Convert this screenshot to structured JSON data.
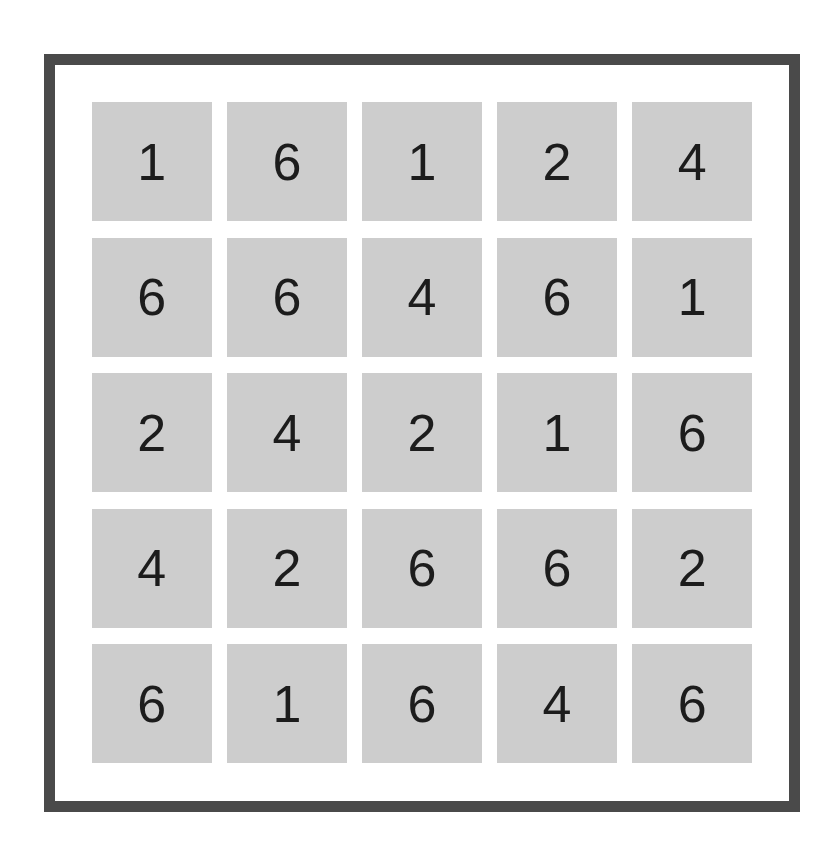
{
  "page": {
    "background_color": "#ffffff"
  },
  "panel": {
    "border_color": "#4a4a4a",
    "border_width_px": 11,
    "background_color": "#ffffff"
  },
  "grid": {
    "rows": 5,
    "columns": 5,
    "cell_background_color": "#cdcdcd",
    "cell_text_color": "#1c1c1c",
    "cells": [
      [
        {
          "value": "1"
        },
        {
          "value": "6"
        },
        {
          "value": "1"
        },
        {
          "value": "2"
        },
        {
          "value": "4"
        }
      ],
      [
        {
          "value": "6"
        },
        {
          "value": "6"
        },
        {
          "value": "4"
        },
        {
          "value": "6"
        },
        {
          "value": "1"
        }
      ],
      [
        {
          "value": "2"
        },
        {
          "value": "4"
        },
        {
          "value": "2"
        },
        {
          "value": "1"
        },
        {
          "value": "6"
        }
      ],
      [
        {
          "value": "4"
        },
        {
          "value": "2"
        },
        {
          "value": "6"
        },
        {
          "value": "6"
        },
        {
          "value": "2"
        }
      ],
      [
        {
          "value": "6"
        },
        {
          "value": "1"
        },
        {
          "value": "6"
        },
        {
          "value": "4"
        },
        {
          "value": "6"
        }
      ]
    ]
  }
}
